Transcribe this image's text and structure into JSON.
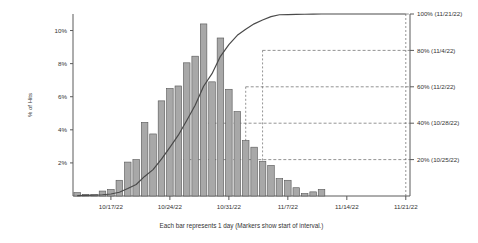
{
  "chart_data": {
    "type": "bar",
    "title": "",
    "xlabel": "Each bar represents 1 day  (Markers show start of interval.)",
    "ylabel": "% of Hits",
    "ylim": [
      0,
      11
    ],
    "y2lim": [
      0,
      100
    ],
    "grid": "horizontal-dashed-at-markers",
    "legend": "none",
    "categories": [
      "10/13/22",
      "10/14/22",
      "10/15/22",
      "10/16/22",
      "10/17/22",
      "10/18/22",
      "10/19/22",
      "10/20/22",
      "10/21/22",
      "10/22/22",
      "10/23/22",
      "10/24/22",
      "10/25/22",
      "10/26/22",
      "10/27/22",
      "10/28/22",
      "10/29/22",
      "10/30/22",
      "10/31/22",
      "11/1/22",
      "11/2/22",
      "11/3/22",
      "11/4/22",
      "11/5/22",
      "11/6/22",
      "11/7/22",
      "11/8/22",
      "11/9/22",
      "11/10/22",
      "11/11/22",
      "11/12/22",
      "11/13/22",
      "11/14/22",
      "11/15/22",
      "11/16/22",
      "11/17/22",
      "11/18/22",
      "11/19/22",
      "11/20/22",
      "11/21/22"
    ],
    "values": [
      0.2,
      0.1,
      0.1,
      0.3,
      0.4,
      0.95,
      2.05,
      2.2,
      4.45,
      3.75,
      5.75,
      6.5,
      6.65,
      8.05,
      8.45,
      10.4,
      6.9,
      9.55,
      6.45,
      5.1,
      3.35,
      2.95,
      2.1,
      1.85,
      1.05,
      0.95,
      0.5,
      0.15,
      0.25,
      0.4,
      0.0,
      0.0,
      0.0,
      0.0,
      0.0,
      0.0,
      0.0,
      0.0,
      0.0,
      0.0
    ],
    "series": [
      {
        "name": "% of Hits",
        "type": "bar",
        "values": [
          0.2,
          0.1,
          0.1,
          0.3,
          0.4,
          0.95,
          2.05,
          2.2,
          4.45,
          3.75,
          5.75,
          6.5,
          6.65,
          8.05,
          8.45,
          10.4,
          6.9,
          9.55,
          6.45,
          5.1,
          3.35,
          2.95,
          2.1,
          1.85,
          1.05,
          0.95,
          0.5,
          0.15,
          0.25,
          0.4,
          0.0,
          0.0,
          0.0,
          0.0,
          0.0,
          0.0,
          0.0,
          0.0,
          0.0,
          0.0
        ]
      },
      {
        "name": "Cumulative %",
        "type": "line",
        "axis": "right",
        "values": [
          0.2,
          0.3,
          0.4,
          0.7,
          1.1,
          2.05,
          4.1,
          6.3,
          10.75,
          14.5,
          20.25,
          26.75,
          33.4,
          41.45,
          49.9,
          60.3,
          67.2,
          76.75,
          83.2,
          88.3,
          91.65,
          94.6,
          96.7,
          98.55,
          99.6,
          99.7,
          99.8,
          99.85,
          99.9,
          100.0,
          100.0,
          100.0,
          100.0,
          100.0,
          100.0,
          100.0,
          100.0,
          100.0,
          100.0,
          100.0
        ]
      }
    ],
    "y_ticks": [
      "2%",
      "4%",
      "6%",
      "8%",
      "10%"
    ],
    "y_tick_values": [
      2,
      4,
      6,
      8,
      10
    ],
    "x_ticks": [
      "10/17/22",
      "10/24/22",
      "10/31/22",
      "11/7/22",
      "11/14/22",
      "11/21/22"
    ],
    "x_tick_index": [
      4,
      11,
      18,
      25,
      32,
      39
    ],
    "markers": [
      {
        "label": "100% (11/21/22)",
        "pct": 100,
        "date": "11/21/22"
      },
      {
        "label": "80% (11/4/22)",
        "pct": 80,
        "date": "11/4/22"
      },
      {
        "label": "60% (11/2/22)",
        "pct": 60,
        "date": "11/2/22"
      },
      {
        "label": "40% (10/28/22)",
        "pct": 40,
        "date": "10/28/22"
      },
      {
        "label": "20% (10/25/22)",
        "pct": 20,
        "date": "10/25/22"
      }
    ],
    "colors": {
      "bar_fill": "#a8a8a8",
      "bar_edge": "#555555",
      "line": "#4a4a4a",
      "axis": "#5a5a5a",
      "marker_line": "#666666",
      "background": "#ffffff"
    }
  },
  "axes": {
    "y_title": "% of Hits",
    "caption": "Each bar represents 1 day  (Markers show start of interval.)"
  }
}
